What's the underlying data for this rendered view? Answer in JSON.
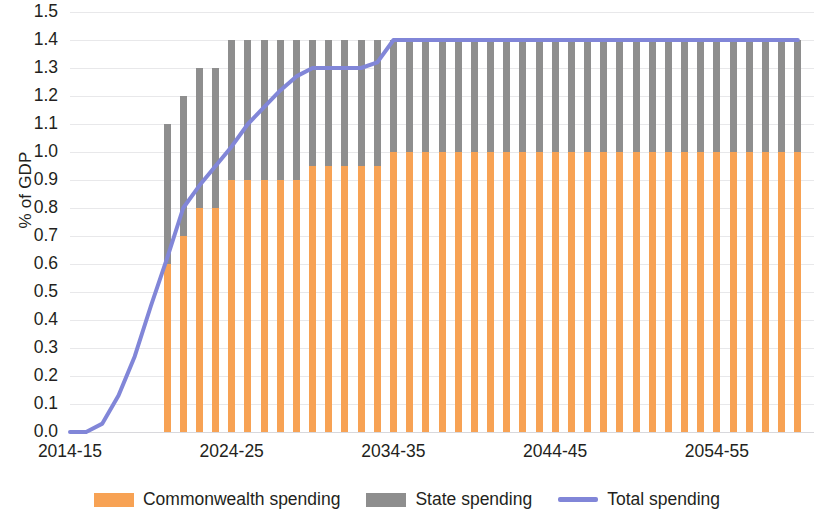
{
  "chart_data": {
    "type": "bar",
    "title": "",
    "subtitle": "",
    "xlabel": "",
    "ylabel": "% of GDP",
    "ylim": [
      0.0,
      1.5
    ],
    "ytick_step": 0.1,
    "grid": true,
    "legend_position": "bottom",
    "stacked": true,
    "ytick_labels": [
      "1.5",
      "1.4",
      "1.3",
      "1.2",
      "1.1",
      "1.0",
      "0.9",
      "0.8",
      "0.7",
      "0.6",
      "0.5",
      "0.4",
      "0.3",
      "0.2",
      "0.1",
      "0.0"
    ],
    "ytick_values": [
      1.5,
      1.4,
      1.3,
      1.2,
      1.1,
      1.0,
      0.9,
      0.8,
      0.7,
      0.6,
      0.5,
      0.4,
      0.3,
      0.2,
      0.1,
      0.0
    ],
    "xtick_labels": [
      "2014-15",
      "2024-25",
      "2034-35",
      "2044-45",
      "2054-55"
    ],
    "xtick_years": [
      2014,
      2024,
      2034,
      2044,
      2054
    ],
    "x_start_year": 2014,
    "x_end_year": 2060,
    "categories": [
      "2014-15",
      "2015-16",
      "2016-17",
      "2017-18",
      "2018-19",
      "2019-20",
      "2020-21",
      "2021-22",
      "2022-23",
      "2023-24",
      "2024-25",
      "2025-26",
      "2026-27",
      "2027-28",
      "2028-29",
      "2029-30",
      "2030-31",
      "2031-32",
      "2032-33",
      "2033-34",
      "2034-35",
      "2035-36",
      "2036-37",
      "2037-38",
      "2038-39",
      "2039-40",
      "2040-41",
      "2041-42",
      "2042-43",
      "2043-44",
      "2044-45",
      "2045-46",
      "2046-47",
      "2047-48",
      "2048-49",
      "2049-50",
      "2050-51",
      "2051-52",
      "2052-53",
      "2053-54",
      "2054-55",
      "2055-56",
      "2056-57",
      "2057-58",
      "2058-59",
      "2059-60"
    ],
    "series": [
      {
        "name": "Commonwealth spending",
        "color": "#f7a254",
        "kind": "bar-segment",
        "values": [
          null,
          null,
          null,
          null,
          null,
          null,
          0.6,
          0.7,
          0.8,
          0.8,
          0.9,
          0.9,
          0.9,
          0.9,
          0.9,
          0.95,
          0.95,
          0.95,
          0.95,
          0.95,
          1.0,
          1.0,
          1.0,
          1.0,
          1.0,
          1.0,
          1.0,
          1.0,
          1.0,
          1.0,
          1.0,
          1.0,
          1.0,
          1.0,
          1.0,
          1.0,
          1.0,
          1.0,
          1.0,
          1.0,
          1.0,
          1.0,
          1.0,
          1.0,
          1.0,
          1.0
        ]
      },
      {
        "name": "State spending",
        "color": "#8e8e8e",
        "kind": "bar-segment",
        "values": [
          null,
          null,
          null,
          null,
          null,
          null,
          0.5,
          0.5,
          0.5,
          0.5,
          0.5,
          0.5,
          0.5,
          0.5,
          0.5,
          0.45,
          0.45,
          0.45,
          0.45,
          0.45,
          0.4,
          0.4,
          0.4,
          0.4,
          0.4,
          0.4,
          0.4,
          0.4,
          0.4,
          0.4,
          0.4,
          0.4,
          0.4,
          0.4,
          0.4,
          0.4,
          0.4,
          0.4,
          0.4,
          0.4,
          0.4,
          0.4,
          0.4,
          0.4,
          0.4,
          0.4
        ]
      },
      {
        "name": "Total spending",
        "color": "#8186d8",
        "kind": "line",
        "values": [
          0.0,
          0.0,
          0.03,
          0.13,
          0.27,
          0.45,
          0.62,
          0.8,
          0.88,
          0.95,
          1.02,
          1.1,
          1.16,
          1.22,
          1.27,
          1.3,
          1.3,
          1.3,
          1.3,
          1.32,
          1.4,
          1.4,
          1.4,
          1.4,
          1.4,
          1.4,
          1.4,
          1.4,
          1.4,
          1.4,
          1.4,
          1.4,
          1.4,
          1.4,
          1.4,
          1.4,
          1.4,
          1.4,
          1.4,
          1.4,
          1.4,
          1.4,
          1.4,
          1.4,
          1.4,
          1.4
        ]
      }
    ],
    "legend": [
      {
        "label": "Commonwealth spending",
        "color": "#f7a254",
        "marker": "square"
      },
      {
        "label": "State spending",
        "color": "#8e8e8e",
        "marker": "square"
      },
      {
        "label": "Total spending",
        "color": "#8186d8",
        "marker": "line"
      }
    ]
  },
  "colors": {
    "commonwealth": "#f7a254",
    "state": "#8e8e8e",
    "total_line": "#8186d8",
    "gridline": "#e8e8ea",
    "text": "#231f20",
    "background": "#ffffff"
  }
}
